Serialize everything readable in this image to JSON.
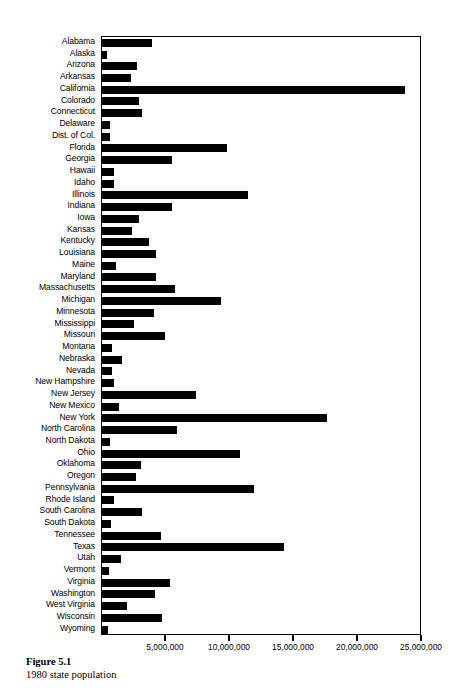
{
  "figure": {
    "caption_label": "Figure 5.1",
    "caption_text": "1980 state population"
  },
  "chart_data": {
    "type": "bar",
    "orientation": "horizontal",
    "title": "1980 state population",
    "xlabel": "",
    "ylabel": "",
    "xlim": [
      0,
      25000000
    ],
    "grid": false,
    "legend": null,
    "axis_ticks": [
      "5,000,000",
      "10,000,000",
      "15,000,000",
      "20,000,000",
      "25,000,000"
    ],
    "axis_tick_values": [
      5000000,
      10000000,
      15000000,
      20000000,
      25000000
    ],
    "bar_color": "#000000",
    "categories": [
      "Alabama",
      "Alaska",
      "Arizona",
      "Arkansas",
      "California",
      "Colorado",
      "Connecticut",
      "Delaware",
      "Dist. of Col.",
      "Florida",
      "Georgia",
      "Hawaii",
      "Idaho",
      "Illinois",
      "Indiana",
      "Iowa",
      "Kansas",
      "Kentucky",
      "Louisiana",
      "Maine",
      "Maryland",
      "Massachusetts",
      "Michigan",
      "Minnesota",
      "Mississippi",
      "Missouri",
      "Montana",
      "Nebraska",
      "Nevada",
      "New Hampshire",
      "New Jersey",
      "New Mexico",
      "New York",
      "North Carolina",
      "North Dakota",
      "Ohio",
      "Oklahoma",
      "Oregon",
      "Pennsylvania",
      "Rhode Island",
      "South Carolina",
      "South Dakota",
      "Tennessee",
      "Texas",
      "Utah",
      "Vermont",
      "Virginia",
      "Washington",
      "West Virginia",
      "Wisconsin",
      "Wyoming"
    ],
    "values": [
      3894000,
      402000,
      2718000,
      2286000,
      23668000,
      2890000,
      3108000,
      594000,
      638000,
      9746000,
      5463000,
      965000,
      944000,
      11427000,
      5490000,
      2914000,
      2364000,
      3661000,
      4206000,
      1125000,
      4217000,
      5737000,
      9262000,
      4076000,
      2521000,
      4917000,
      787000,
      1570000,
      800000,
      921000,
      7365000,
      1303000,
      17558000,
      5882000,
      653000,
      10798000,
      3025000,
      2633000,
      11864000,
      947000,
      3122000,
      691000,
      4591000,
      14229000,
      1461000,
      511000,
      5347000,
      4132000,
      1950000,
      4706000,
      470000
    ]
  }
}
